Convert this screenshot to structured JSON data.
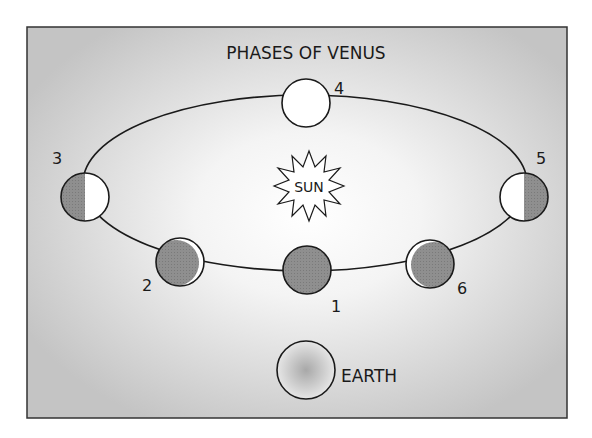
{
  "diagram": {
    "title": "PHASES OF VENUS",
    "sun_label": "SUN",
    "earth_label": "EARTH",
    "colors": {
      "panel_edge": "#c8c8c8",
      "panel_center": "#ffffff",
      "shadow": "#8e8e8e",
      "lit": "#ffffff",
      "outline": "#1a1a1a"
    },
    "phases": [
      {
        "number": "1",
        "phase": "new"
      },
      {
        "number": "2",
        "phase": "crescent-right"
      },
      {
        "number": "3",
        "phase": "half-right-lit"
      },
      {
        "number": "4",
        "phase": "full"
      },
      {
        "number": "5",
        "phase": "half-left-lit"
      },
      {
        "number": "6",
        "phase": "crescent-left"
      }
    ]
  }
}
